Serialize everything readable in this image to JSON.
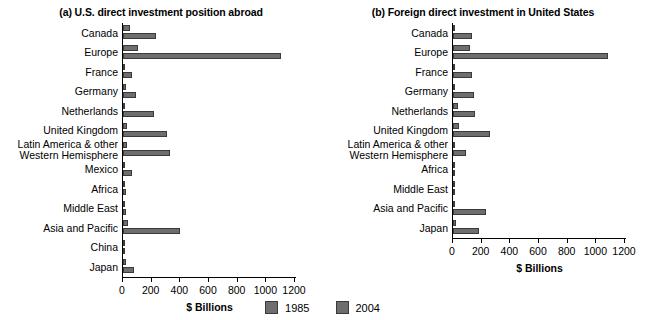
{
  "chart_data": [
    {
      "type": "bar",
      "orientation": "horizontal",
      "title": "(a) U.S. direct investment position abroad",
      "xlabel": "$ Billions",
      "ylabel": "",
      "xlim": [
        0,
        1200
      ],
      "xticks": [
        0,
        200,
        400,
        600,
        800,
        1000,
        1200
      ],
      "xtick_labels": [
        "0",
        "200",
        "400",
        "600",
        "800",
        "1000",
        "1200"
      ],
      "grid": false,
      "legend_position": "bottom-center",
      "categories": [
        "Canada",
        "Europe",
        "France",
        "Germany",
        "Netherlands",
        "United Kingdom",
        "Latin America & other Western Hemisphere",
        "Mexico",
        "Africa",
        "Middle East",
        "Asia and Pacific",
        "China",
        "Japan"
      ],
      "category_lines": [
        [
          "Canada"
        ],
        [
          "Europe"
        ],
        [
          "France"
        ],
        [
          "Germany"
        ],
        [
          "Netherlands"
        ],
        [
          "United Kingdom"
        ],
        [
          "Latin America & other",
          "Western Hemisphere"
        ],
        [
          "Mexico"
        ],
        [
          "Africa"
        ],
        [
          "Middle East"
        ],
        [
          "Asia and Pacific"
        ],
        [
          "China"
        ],
        [
          "Japan"
        ]
      ],
      "series": [
        {
          "name": "1985",
          "color": "#6e6e6e",
          "values": [
            47,
            105,
            15,
            20,
            15,
            30,
            28,
            5,
            6,
            8,
            35,
            1,
            19
          ]
        },
        {
          "name": "2004",
          "color": "#6e6e6e",
          "values": [
            230,
            1100,
            65,
            90,
            215,
            310,
            330,
            66,
            22,
            20,
            395,
            15,
            80
          ]
        }
      ]
    },
    {
      "type": "bar",
      "orientation": "horizontal",
      "title": "(b) Foreign direct investment in United States",
      "xlabel": "$ Billions",
      "ylabel": "",
      "xlim": [
        0,
        1200
      ],
      "xticks": [
        0,
        200,
        400,
        600,
        800,
        1000,
        1200
      ],
      "xtick_labels": [
        "0",
        "200",
        "400",
        "600",
        "800",
        "1000",
        "1200"
      ],
      "grid": false,
      "legend_position": "bottom-center",
      "categories": [
        "Canada",
        "Europe",
        "France",
        "Germany",
        "Netherlands",
        "United Kingdom",
        "Latin America & other Western Hemisphere",
        "Africa",
        "Middle East",
        "Asia and Pacific",
        "Japan"
      ],
      "category_lines": [
        [
          "Canada"
        ],
        [
          "Europe"
        ],
        [
          "France"
        ],
        [
          "Germany"
        ],
        [
          "Netherlands"
        ],
        [
          "United Kingdom"
        ],
        [
          "Latin America & other",
          "Western Hemisphere"
        ],
        [
          "Africa"
        ],
        [
          "Middle East"
        ],
        [
          "Asia and Pacific"
        ],
        [
          "Japan"
        ]
      ],
      "series": [
        {
          "name": "1985",
          "color": "#6e6e6e",
          "values": [
            17,
            121,
            6,
            15,
            37,
            44,
            14,
            1,
            5,
            2,
            19
          ]
        },
        {
          "name": "2004",
          "color": "#6e6e6e",
          "values": [
            134,
            1080,
            135,
            148,
            152,
            255,
            90,
            3,
            8,
            230,
            180
          ]
        }
      ]
    }
  ],
  "legend": {
    "items": [
      {
        "label": "1985",
        "color": "#6e6e6e"
      },
      {
        "label": "2004",
        "color": "#6e6e6e"
      }
    ]
  }
}
